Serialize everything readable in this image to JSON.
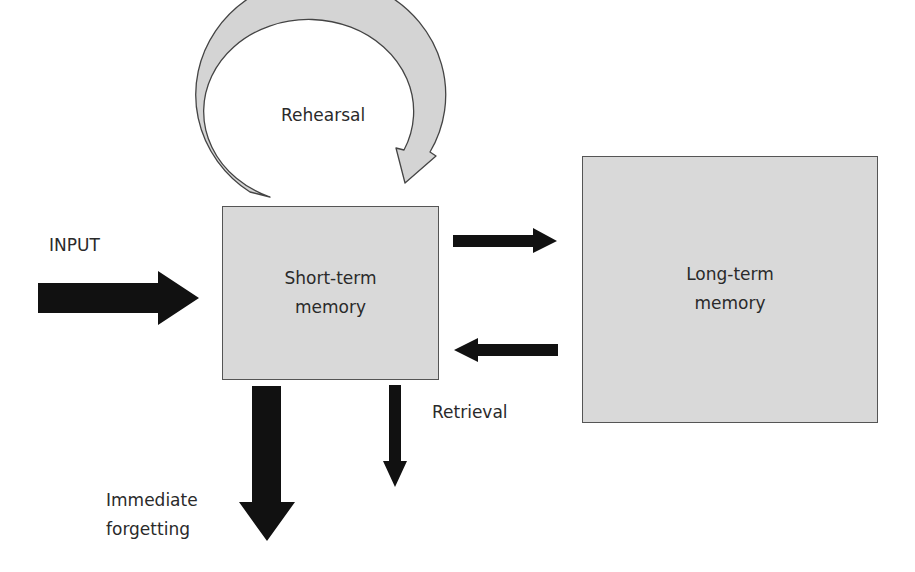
{
  "diagram": {
    "nodes": {
      "short_term": {
        "line1": "Short-term",
        "line2": "memory"
      },
      "long_term": {
        "line1": "Long-term",
        "line2": "memory"
      }
    },
    "labels": {
      "input": "INPUT",
      "rehearsal": "Rehearsal",
      "retrieval": "Retrieval",
      "forgetting_line1": "Immediate",
      "forgetting_line2": "forgetting"
    },
    "edges": [
      {
        "from": "INPUT",
        "to": "Short-term memory",
        "style": "thick black arrow"
      },
      {
        "from": "Short-term memory",
        "to": "Short-term memory",
        "label": "Rehearsal",
        "style": "grey curved loop arrow"
      },
      {
        "from": "Short-term memory",
        "to": "Long-term memory",
        "style": "black arrow"
      },
      {
        "from": "Long-term memory",
        "to": "Short-term memory",
        "style": "black arrow"
      },
      {
        "from": "Short-term memory",
        "to": "Immediate forgetting",
        "style": "thick black down arrow"
      },
      {
        "from": "Short-term memory",
        "to": "Retrieval",
        "style": "thin black down arrow"
      }
    ],
    "colors": {
      "box_fill": "#d9d9d9",
      "box_border": "#555555",
      "arrow": "#111111",
      "loop_fill": "#d4d4d4",
      "text": "#2a2a2a"
    }
  }
}
